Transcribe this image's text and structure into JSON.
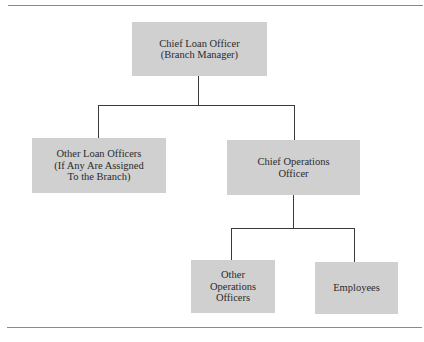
{
  "diagram": {
    "type": "org-chart",
    "nodes": [
      {
        "id": "chief-loan-officer",
        "label": "Chief Loan Officer\n(Branch Manager)",
        "parent": null
      },
      {
        "id": "other-loan-officers",
        "label": "Other Loan Officers\n(If Any Are Assigned\nTo the Branch)",
        "parent": "chief-loan-officer"
      },
      {
        "id": "chief-operations-officer",
        "label": "Chief Operations\nOfficer",
        "parent": "chief-loan-officer"
      },
      {
        "id": "other-operations-officers",
        "label": "Other\nOperations\nOfficers",
        "parent": "chief-operations-officer"
      },
      {
        "id": "employees",
        "label": "Employees",
        "parent": "chief-operations-officer"
      }
    ],
    "colors": {
      "box_fill": "#d0d0d0",
      "connector": "#3a3a3a",
      "rule": "#8a8a8a",
      "text": "#2b2b2b"
    }
  }
}
